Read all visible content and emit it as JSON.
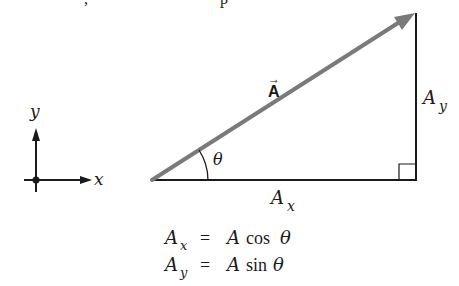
{
  "figure": {
    "cropped_top_text": {
      "frag1": ",",
      "frag2": "p"
    },
    "axes": {
      "x_label": "x",
      "y_label": "y"
    },
    "vector": {
      "label": "A",
      "arrow": "→",
      "color": "#7a7a7a"
    },
    "angle_label": "θ",
    "components": {
      "x": {
        "base": "A",
        "sub": "x"
      },
      "y": {
        "base": "A",
        "sub": "y"
      }
    },
    "equations": [
      {
        "lhs_base": "A",
        "lhs_sub": "x",
        "eq": "=",
        "rhs_A": "A",
        "fn": "cos",
        "arg": "θ"
      },
      {
        "lhs_base": "A",
        "lhs_sub": "y",
        "eq": "=",
        "rhs_A": "A",
        "fn": "sin",
        "arg": "θ"
      }
    ],
    "colors": {
      "line": "#1a1a1a",
      "vector": "#7a7a7a"
    }
  }
}
